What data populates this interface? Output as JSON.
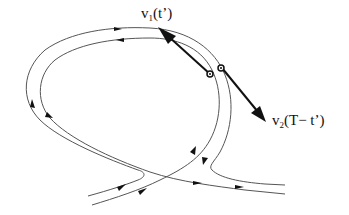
{
  "diagram": {
    "type": "phase-space trajectory sketch",
    "colors": {
      "trajectory": "#555555",
      "vector": "#111111",
      "background": "#ffffff"
    },
    "labels": {
      "v1": {
        "base": "v",
        "sub": "1",
        "arg": "(t’)"
      },
      "v2": {
        "base": "v",
        "sub": "2",
        "arg": "(T− t’)"
      }
    },
    "elements": [
      "outer-trajectory",
      "inner-trajectory",
      "vector-v1-arrow",
      "vector-v2-arrow",
      "point-on-inner-trajectory",
      "point-on-outer-trajectory"
    ]
  }
}
